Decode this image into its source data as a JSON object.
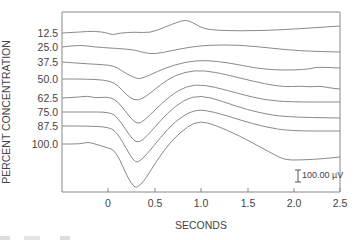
{
  "chart_data": {
    "type": "line",
    "title": "",
    "xlabel": "SECONDS",
    "ylabel": "PERCENT CONCENTRATION",
    "xlim": [
      -0.5,
      2.5
    ],
    "x_ticks": [
      "0",
      "0.5",
      "1.0",
      "1.5",
      "2.0",
      "2.5"
    ],
    "x_tick_values": [
      0,
      0.5,
      1.0,
      1.5,
      2.0,
      2.5
    ],
    "grid": false,
    "legend": "none (traces labeled on left axis)",
    "scale_bar": {
      "label": "100.00 µV",
      "value_uV": 100
    },
    "y_unit_note": "traces offset vertically; scale bar 100 µV ≈ 12 px",
    "series": [
      {
        "name": "12.5",
        "points_px": [
          [
            62,
            33
          ],
          [
            80,
            32
          ],
          [
            95,
            31
          ],
          [
            108,
            33
          ],
          [
            112,
            35
          ],
          [
            120,
            33
          ],
          [
            135,
            32
          ],
          [
            150,
            33
          ],
          [
            165,
            27
          ],
          [
            178,
            22
          ],
          [
            185,
            20
          ],
          [
            192,
            22
          ],
          [
            200,
            27
          ],
          [
            210,
            30
          ],
          [
            240,
            31
          ],
          [
            280,
            30
          ],
          [
            340,
            26
          ]
        ]
      },
      {
        "name": "25.0",
        "points_px": [
          [
            62,
            47
          ],
          [
            80,
            45
          ],
          [
            95,
            47
          ],
          [
            110,
            48
          ],
          [
            125,
            49
          ],
          [
            135,
            50
          ],
          [
            145,
            53
          ],
          [
            155,
            54
          ],
          [
            170,
            51
          ],
          [
            190,
            47
          ],
          [
            210,
            45
          ],
          [
            240,
            45
          ],
          [
            270,
            48
          ],
          [
            300,
            51
          ],
          [
            340,
            52
          ]
        ]
      },
      {
        "name": "37.5",
        "points_px": [
          [
            62,
            62
          ],
          [
            90,
            64
          ],
          [
            110,
            65
          ],
          [
            118,
            68
          ],
          [
            125,
            73
          ],
          [
            135,
            78
          ],
          [
            140,
            79
          ],
          [
            150,
            75
          ],
          [
            165,
            68
          ],
          [
            185,
            62
          ],
          [
            205,
            60
          ],
          [
            230,
            63
          ],
          [
            255,
            68
          ],
          [
            275,
            70
          ],
          [
            295,
            70
          ],
          [
            310,
            69
          ],
          [
            316,
            67
          ],
          [
            340,
            68
          ]
        ]
      },
      {
        "name": "50.0",
        "points_px": [
          [
            62,
            79
          ],
          [
            85,
            79
          ],
          [
            105,
            80
          ],
          [
            115,
            83
          ],
          [
            122,
            90
          ],
          [
            130,
            98
          ],
          [
            138,
            101
          ],
          [
            148,
            95
          ],
          [
            160,
            85
          ],
          [
            175,
            75
          ],
          [
            195,
            70
          ],
          [
            215,
            72
          ],
          [
            240,
            78
          ],
          [
            265,
            84
          ],
          [
            285,
            87
          ],
          [
            300,
            86
          ],
          [
            310,
            87
          ],
          [
            320,
            86
          ],
          [
            330,
            88
          ],
          [
            340,
            89
          ]
        ]
      },
      {
        "name": "62.5",
        "points_px": [
          [
            62,
            98
          ],
          [
            80,
            97
          ],
          [
            88,
            96
          ],
          [
            95,
            98
          ],
          [
            105,
            97
          ],
          [
            112,
            98
          ],
          [
            118,
            102
          ],
          [
            126,
            112
          ],
          [
            134,
            122
          ],
          [
            140,
            124
          ],
          [
            150,
            115
          ],
          [
            162,
            103
          ],
          [
            178,
            90
          ],
          [
            195,
            84
          ],
          [
            215,
            87
          ],
          [
            240,
            94
          ],
          [
            265,
            100
          ],
          [
            290,
            102
          ],
          [
            340,
            102
          ]
        ]
      },
      {
        "name": "75.0",
        "points_px": [
          [
            62,
            112
          ],
          [
            85,
            112
          ],
          [
            110,
            112
          ],
          [
            118,
            118
          ],
          [
            126,
            130
          ],
          [
            133,
            140
          ],
          [
            139,
            143
          ],
          [
            148,
            135
          ],
          [
            160,
            121
          ],
          [
            175,
            106
          ],
          [
            192,
            96
          ],
          [
            210,
            97
          ],
          [
            235,
            106
          ],
          [
            260,
            113
          ],
          [
            285,
            117
          ],
          [
            340,
            118
          ]
        ]
      },
      {
        "name": "87.5",
        "points_px": [
          [
            62,
            126
          ],
          [
            85,
            126
          ],
          [
            110,
            127
          ],
          [
            118,
            134
          ],
          [
            126,
            148
          ],
          [
            133,
            160
          ],
          [
            138,
            163
          ],
          [
            148,
            153
          ],
          [
            160,
            138
          ],
          [
            175,
            121
          ],
          [
            195,
            109
          ],
          [
            215,
            112
          ],
          [
            240,
            120
          ],
          [
            265,
            127
          ],
          [
            290,
            131
          ],
          [
            340,
            131
          ]
        ]
      },
      {
        "name": "100.0",
        "points_px": [
          [
            62,
            144
          ],
          [
            80,
            144
          ],
          [
            88,
            142
          ],
          [
            95,
            144
          ],
          [
            102,
            146
          ],
          [
            108,
            148
          ],
          [
            114,
            150
          ],
          [
            120,
            160
          ],
          [
            127,
            176
          ],
          [
            133,
            186
          ],
          [
            137,
            188
          ],
          [
            145,
            180
          ],
          [
            157,
            160
          ],
          [
            172,
            140
          ],
          [
            188,
            126
          ],
          [
            200,
            121
          ],
          [
            215,
            125
          ],
          [
            240,
            136
          ],
          [
            262,
            148
          ],
          [
            275,
            155
          ],
          [
            285,
            160
          ],
          [
            300,
            160
          ],
          [
            320,
            159
          ],
          [
            340,
            157
          ]
        ]
      }
    ],
    "series_labels_y_px": [
      33,
      47,
      62,
      79,
      98,
      112,
      126,
      144
    ]
  },
  "axis": {
    "x_title": "SECONDS",
    "y_title": "PERCENT CONCENTRATION",
    "x_ticks": [
      {
        "label": "0",
        "x": 108
      },
      {
        "label": "0.5",
        "x": 155
      },
      {
        "label": "1.0",
        "x": 201
      },
      {
        "label": "1.5",
        "x": 248
      },
      {
        "label": "2.0",
        "x": 294
      },
      {
        "label": "2.5",
        "x": 340
      }
    ]
  },
  "labels": [
    "12.5",
    "25.0",
    "37.5",
    "50.0",
    "62.5",
    "75.0",
    "87.5",
    "100.0"
  ],
  "scale_bar_label": "100.00 µV",
  "colors": {
    "trace": "#8a8a8a",
    "axis": "#777777",
    "text": "#444444"
  }
}
